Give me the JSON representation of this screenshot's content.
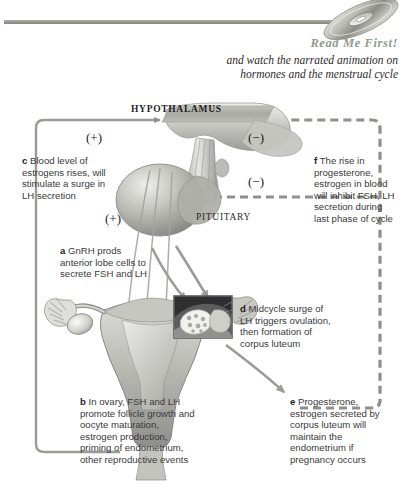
{
  "header": {
    "readme_label": "Read Me First!",
    "subtitle_line1": "and watch the narrated animation on",
    "subtitle_line2": "hormones and the menstrual cycle",
    "cd_icon": "compact-disc-icon",
    "readme_color": "#909a8c",
    "rule_color": "#8d8f86"
  },
  "diagram": {
    "organs": {
      "hypothalamus": "HYPOTHALAMUS",
      "pituitary": "PITUITARY"
    },
    "signs": {
      "plus_top": "(+)",
      "plus_bottom": "(+)",
      "minus_top": "(−)",
      "minus_mid": "(−)"
    },
    "steps": [
      {
        "key": "a",
        "letter": "a",
        "text": "GnRH prods anterior lobe cells to secrete FSH and LH"
      },
      {
        "key": "b",
        "letter": "b",
        "text": "In ovary, FSH and LH promote follicle growth and oocyte maturation, estrogen production, priming of endometrium, other reproductive events"
      },
      {
        "key": "c",
        "letter": "c",
        "text": "Blood level of estrogens rises, will stimulate a surge in LH secretion"
      },
      {
        "key": "d",
        "letter": "d",
        "text": "Midcycle surge of LH triggers ovulation, then formation of corpus luteum"
      },
      {
        "key": "e",
        "letter": "e",
        "text": "Progesterone, estrogen secreted by corpus luteum will maintain the endometrium if pregnancy occurs"
      },
      {
        "key": "f",
        "letter": "f",
        "text": "The rise in progesterone, estrogen in blood will inhibit FSH, LH secretion during last phase of cycle"
      }
    ],
    "colors": {
      "arrow_gray": "#8e9089",
      "anatomy_light": "#d8d8d4",
      "anatomy_mid": "#a8a8a4",
      "anatomy_dark": "#6f6f6c",
      "inset_dark": "#2f2f31"
    },
    "inset_label": "ovary-follicle-inset"
  }
}
